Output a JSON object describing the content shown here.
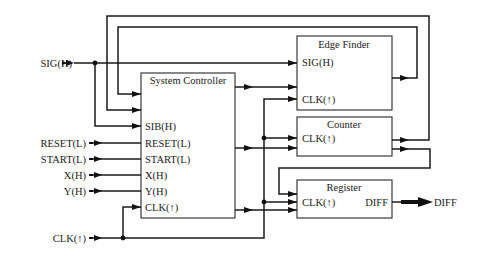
{
  "diagram": {
    "type": "block-diagram",
    "colors": {
      "line": "#1a1a1a",
      "box_border": "#3a3a3a",
      "background": "#ffffff"
    },
    "external_inputs": {
      "sig": "SIG(H)",
      "reset": "RESET(L)",
      "start": "START(L)",
      "x": "X(H)",
      "y": "Y(H)",
      "clk": "CLK(↑)"
    },
    "external_outputs": {
      "diff": "DIFF"
    },
    "blocks": {
      "system_controller": {
        "title": "System Controller",
        "ports": {
          "sib": "SIB(H)",
          "reset": "RESET(L)",
          "start": "START(L)",
          "x": "X(H)",
          "y": "Y(H)",
          "clk": "CLK(↑)"
        }
      },
      "edge_finder": {
        "title": "Edge Finder",
        "ports": {
          "sig": "SIG(H)",
          "clk": "CLK(↑)"
        }
      },
      "counter": {
        "title": "Counter",
        "ports": {
          "clk": "CLK(↑)"
        }
      },
      "register": {
        "title": "Register",
        "ports": {
          "clk": "CLK(↑)",
          "diff": "DIFF"
        }
      }
    }
  }
}
